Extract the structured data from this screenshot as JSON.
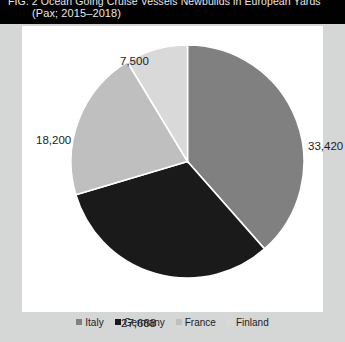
{
  "title": {
    "line1": "FIG. 2  Ocean Going Cruise Vessels Newbuilds in European Yards",
    "line2": "(Pax; 2015–2018)"
  },
  "chart_data": {
    "type": "pie",
    "title": "FIG. 2  Ocean Going Cruise Vessels Newbuilds in European Yards (Pax; 2015–2018)",
    "xlabel": "",
    "ylabel": "",
    "unit": "Pax",
    "period": "2015–2018",
    "legend_position": "bottom",
    "grid": false,
    "categories": [
      "Italy",
      "Germany",
      "France",
      "Finland"
    ],
    "values": [
      33420,
      27688,
      18200,
      7500
    ],
    "labels": [
      "33,420",
      "27,688",
      "18,200",
      "7,500"
    ],
    "colors": [
      "#808080",
      "#1a1a1a",
      "#bfbfbf",
      "#d9d9d9"
    ],
    "percentages": [
      38.5,
      31.9,
      21.0,
      8.6
    ],
    "total": 86808,
    "slices": [
      {
        "name": "Italy",
        "value": 33420,
        "label": "33,420",
        "color": "#808080",
        "percent": 38.5
      },
      {
        "name": "Germany",
        "value": 27688,
        "label": "27,688",
        "color": "#1a1a1a",
        "percent": 31.9
      },
      {
        "name": "France",
        "value": 18200,
        "label": "18,200",
        "color": "#bfbfbf",
        "percent": 21.0
      },
      {
        "name": "Finland",
        "value": 7500,
        "label": "7,500",
        "color": "#d9d9d9",
        "percent": 8.6
      }
    ]
  },
  "legend": {
    "items": [
      {
        "label": "Italy",
        "color": "#808080"
      },
      {
        "label": "Germany",
        "color": "#1a1a1a"
      },
      {
        "label": "France",
        "color": "#bfbfbf"
      },
      {
        "label": "Finland",
        "color": "#d9d9d9"
      }
    ]
  }
}
